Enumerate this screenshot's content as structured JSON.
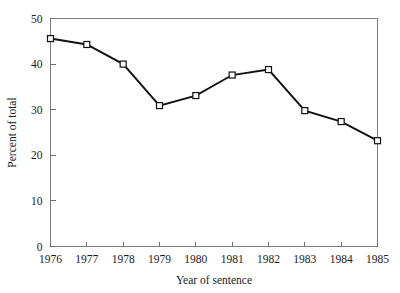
{
  "chart_data": {
    "type": "line",
    "title": "",
    "xlabel": "Year of sentence",
    "ylabel": "Percent of total",
    "categories": [
      "1976",
      "1977",
      "1978",
      "1979",
      "1980",
      "1981",
      "1982",
      "1983",
      "1984",
      "1985"
    ],
    "values": [
      45.6,
      44.3,
      40.0,
      30.9,
      33.1,
      37.6,
      38.8,
      29.8,
      27.4,
      23.2
    ],
    "x": [
      1976,
      1977,
      1978,
      1979,
      1980,
      1981,
      1982,
      1983,
      1984,
      1985
    ],
    "xlim": [
      1976,
      1985
    ],
    "ylim": [
      0,
      50
    ],
    "yticks": [
      0,
      10,
      20,
      30,
      40,
      50
    ],
    "ytick_labels": [
      "0",
      "10",
      "20",
      "30",
      "40",
      "50"
    ],
    "xtick_labels": [
      "1976",
      "1977",
      "1978",
      "1979",
      "1980",
      "1981",
      "1982",
      "1983",
      "1984",
      "1985"
    ],
    "grid": false,
    "legend": null,
    "legend_position": "none",
    "marker": "open-square",
    "line_color": "#111111",
    "marker_fill": "#ffffff",
    "frame_color": "#7d7d7d",
    "background": "#ffffff"
  }
}
